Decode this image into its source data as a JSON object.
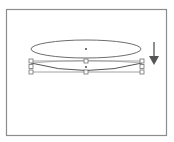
{
  "diagram": {
    "colors": {
      "frame": "#8c8c8c",
      "stroke": "#6e6e6e",
      "handle_fill": "#ffffff",
      "handle_stroke": "#707070",
      "arrow": "#555555",
      "background": "#ffffff"
    },
    "frame": {
      "x": 6,
      "y": 9,
      "width": 160,
      "height": 126
    },
    "original_ellipse": {
      "cx": 86,
      "cy": 49,
      "rx": 55,
      "ry": 9,
      "center_mark": true
    },
    "transformed_shape": {
      "bbox": {
        "x1": 31,
        "y1": 61,
        "x2": 142,
        "y2": 72
      },
      "center": {
        "x": 86,
        "y": 67
      },
      "handles": [
        {
          "x": 31,
          "y": 61
        },
        {
          "x": 86,
          "y": 61
        },
        {
          "x": 142,
          "y": 61
        },
        {
          "x": 31,
          "y": 66.5
        },
        {
          "x": 142,
          "y": 66.5
        },
        {
          "x": 31,
          "y": 72
        },
        {
          "x": 86,
          "y": 72
        },
        {
          "x": 142,
          "y": 72
        }
      ]
    },
    "arrow": {
      "direction": "down",
      "x": 154,
      "y1": 42,
      "y2": 65
    }
  }
}
